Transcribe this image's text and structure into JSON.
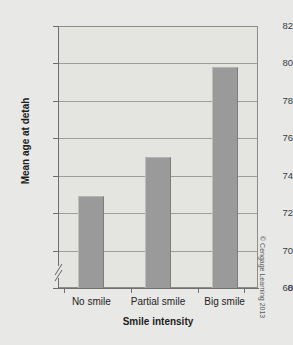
{
  "chart_data": {
    "type": "bar",
    "title": "",
    "subtitle": "",
    "xlabel": "Smile intensity",
    "ylabel": "Mean age at detah",
    "categories": [
      "No smile",
      "Partial smile",
      "Big smile"
    ],
    "values": [
      72.9,
      75.0,
      79.8
    ],
    "ylim": [
      68,
      82
    ],
    "yticks": [
      82,
      80,
      78,
      76,
      74,
      72,
      70,
      68
    ],
    "ytick_labels": [
      "82",
      "80",
      "78",
      "76",
      "74",
      "72",
      "70",
      "68"
    ],
    "axis_origin_label": "0",
    "axis_break": true,
    "grid": true,
    "legend": null,
    "series": [
      {
        "name": "Mean age at death",
        "values": [
          72.9,
          75.0,
          79.8
        ]
      }
    ],
    "bar_color": "#9a9a9a",
    "plot_background": "#e4e4e1",
    "figure_background": "#e8e8e6",
    "gridline_color": "#9d9d9d",
    "axis_color": "#6f6f6f"
  },
  "credit": {
    "text": "© Cengage Learning 2013"
  }
}
